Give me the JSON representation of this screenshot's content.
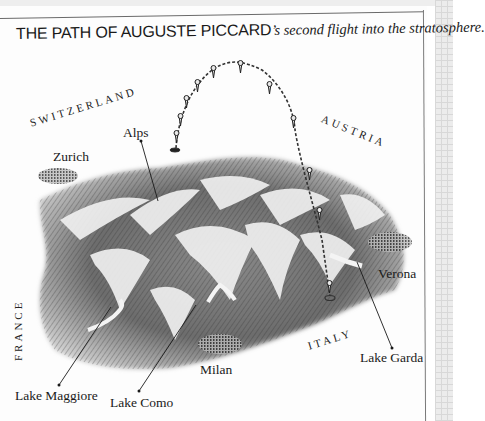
{
  "title": {
    "caps": "THE PATH OF AUGUSTE PICCARD",
    "italic": "’s second flight into the stratosphere."
  },
  "map": {
    "countries": [
      {
        "id": "switzerland",
        "label": "SWITZERLAND"
      },
      {
        "id": "austria",
        "label": "AUSTRIA"
      },
      {
        "id": "france",
        "label": "FRANCE"
      },
      {
        "id": "italy",
        "label": "ITALY"
      }
    ],
    "places": [
      {
        "id": "zurich",
        "label": "Zurich"
      },
      {
        "id": "alps",
        "label": "Alps"
      },
      {
        "id": "verona",
        "label": "Verona"
      },
      {
        "id": "milan",
        "label": "Milan"
      },
      {
        "id": "lake-garda",
        "label": "Lake Garda"
      },
      {
        "id": "lake-maggiore",
        "label": "Lake Maggiore"
      },
      {
        "id": "lake-como",
        "label": "Lake Como"
      }
    ],
    "flight_path": {
      "description": "Dashed arc of balloon positions from launch near Zurich side to landing near Lake Garda",
      "balloon_count": 10
    }
  },
  "colors": {
    "ink": "#1a1a1a",
    "terrain_dark": "#3a3a3a",
    "terrain_light": "#e6e6e6",
    "paper": "#fdfdfd"
  }
}
